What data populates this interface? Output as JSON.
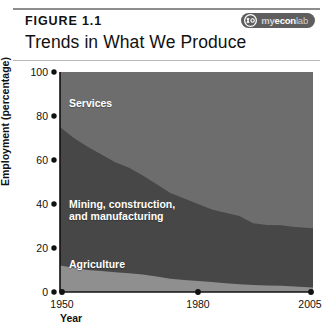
{
  "figure": {
    "label": "FIGURE 1.1",
    "title": "Trends in What We Produce"
  },
  "badge": {
    "name": "myeconlab-badge",
    "icon": "myeconlab-logo-icon",
    "text_my": "my",
    "text_econ": "econ",
    "text_lab": "lab",
    "background_color": "#5e5e5e"
  },
  "chart_data": {
    "type": "area",
    "stacked": true,
    "title": "Trends in What We Produce",
    "xlabel": "Year",
    "ylabel": "Employment (percentage)",
    "xlim": [
      1950,
      2005
    ],
    "ylim": [
      0,
      100
    ],
    "grid": false,
    "legend": "inline-area-labels",
    "xtick_labels": [
      "1950",
      "1980",
      "2005"
    ],
    "xticks": [
      1950,
      1980,
      2005
    ],
    "ytick_labels": [
      "0",
      "20",
      "40",
      "60",
      "80",
      "100"
    ],
    "yticks": [
      0,
      20,
      40,
      60,
      80,
      100
    ],
    "x": [
      1950,
      1953,
      1956,
      1959,
      1962,
      1965,
      1968,
      1971,
      1974,
      1977,
      1980,
      1983,
      1986,
      1989,
      1990,
      1992,
      1995,
      1998,
      2001,
      2005
    ],
    "series": [
      {
        "name": "Agriculture",
        "color": "#8f8f8f",
        "values": [
          12,
          11,
          10,
          9.5,
          9,
          8.5,
          8,
          7,
          6,
          5.5,
          5,
          4.5,
          4,
          3.5,
          3.4,
          3.2,
          3,
          2.8,
          2.5,
          2
        ]
      },
      {
        "name": "Mining, construction, and manufacturing",
        "color": "#474747",
        "values": [
          63,
          59,
          56,
          53,
          50,
          48,
          45,
          42,
          39,
          37,
          35,
          33,
          32,
          31,
          30,
          28,
          27.5,
          27.5,
          27,
          27
        ]
      },
      {
        "name": "Services",
        "color": "#6d6d6d",
        "values": [
          25,
          30,
          34,
          37.5,
          41,
          43.5,
          47,
          51,
          55,
          57.5,
          60,
          62.5,
          64,
          65.5,
          66.6,
          68.8,
          69.5,
          69.7,
          70.5,
          71
        ]
      }
    ],
    "area_labels": [
      {
        "name": "Services",
        "text": "Services"
      },
      {
        "name": "Mining, construction,",
        "text": "Mining, construction,"
      },
      {
        "name": "and manufacturing",
        "text": "and manufacturing"
      },
      {
        "name": "Agriculture",
        "text": "Agriculture"
      }
    ]
  }
}
